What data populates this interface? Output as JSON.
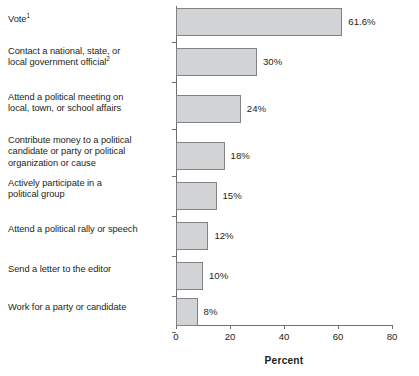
{
  "chart_data": {
    "type": "bar",
    "orientation": "horizontal",
    "title": "",
    "xlabel": "Percent",
    "ylabel": "",
    "xlim": [
      0,
      85
    ],
    "xticks": [
      0,
      20,
      40,
      60,
      80
    ],
    "xtick_labels": [
      "0",
      "20",
      "40",
      "60",
      "80"
    ],
    "grid": false,
    "legend": null,
    "categories": [
      "Vote",
      "Contact a national, state, or local government official",
      "Attend a political meeting on local, town, or school affairs",
      "Contribute money to a political candidate or party or political organization or cause",
      "Actively participate in a political group",
      "Attend a political rally or speech",
      "Send a letter to the editor",
      "Work for a party or candidate"
    ],
    "values": [
      61.6,
      30,
      24,
      18,
      15,
      12,
      10,
      8
    ],
    "value_labels": [
      "61.6%",
      "30%",
      "24%",
      "18%",
      "15%",
      "12%",
      "10%",
      "8%"
    ],
    "bar_fill_color": "#d2d3d4",
    "bar_border_color": "#808285",
    "axis_color": "#6d6e71"
  },
  "categories": [
    {
      "lines": [
        "Vote"
      ],
      "footnote": "1",
      "value_label": "61.6%"
    },
    {
      "lines": [
        "Contact a national, state, or",
        "local government official"
      ],
      "footnote": "2",
      "value_label": "30%"
    },
    {
      "lines": [
        "Attend a political meeting on",
        "local, town, or school affairs"
      ],
      "footnote": "",
      "value_label": "24%"
    },
    {
      "lines": [
        "Contribute money to a political",
        "candidate or party or political",
        "organization or cause"
      ],
      "footnote": "",
      "value_label": "18%"
    },
    {
      "lines": [
        "Actively participate in a",
        "political group"
      ],
      "footnote": "",
      "value_label": "15%"
    },
    {
      "lines": [
        "Attend a political rally or speech"
      ],
      "footnote": "",
      "value_label": "12%"
    },
    {
      "lines": [
        "Send a letter to the editor"
      ],
      "footnote": "",
      "value_label": "10%"
    },
    {
      "lines": [
        "Work for a party or candidate"
      ],
      "footnote": "",
      "value_label": "8%"
    }
  ],
  "axis": {
    "x_title": "Percent",
    "tick_labels": [
      "0",
      "20",
      "40",
      "60",
      "80"
    ]
  }
}
